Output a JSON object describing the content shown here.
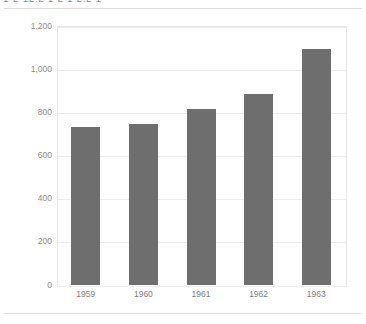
{
  "page": {
    "header_text_clipped": "1-2   12.2     1  2   1 2.2  1",
    "background_color": "#ffffff"
  },
  "chart_data": {
    "type": "bar",
    "title": "",
    "subtitle": "",
    "xlabel": "",
    "ylabel": "",
    "categories": [
      "1959",
      "1960",
      "1961",
      "1962",
      "1963"
    ],
    "values": [
      730,
      745,
      815,
      885,
      1095
    ],
    "series": [
      {
        "name": "",
        "values": [
          730,
          745,
          815,
          885,
          1095
        ]
      }
    ],
    "ylim": [
      0,
      1200
    ],
    "y_ticks": [
      0,
      200,
      400,
      600,
      800,
      1000,
      1200
    ],
    "y_tick_labels": [
      "0",
      "200",
      "400",
      "600",
      "800",
      "1,000",
      "1,200"
    ],
    "grid": true,
    "legend": false,
    "legend_position": "none",
    "bar_color": "#6e6e6e",
    "gridline_color": "#ececec",
    "plot_border_color": "#e6e6e6",
    "annotations": []
  }
}
